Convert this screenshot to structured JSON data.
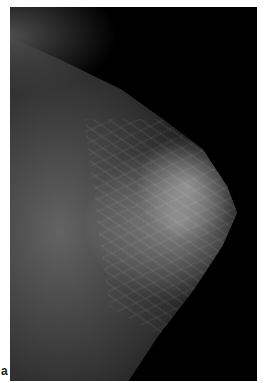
{
  "figure": {
    "panel_label": "a",
    "colors": {
      "background": "#000000",
      "tissue": "#808080",
      "page": "#ffffff"
    }
  }
}
